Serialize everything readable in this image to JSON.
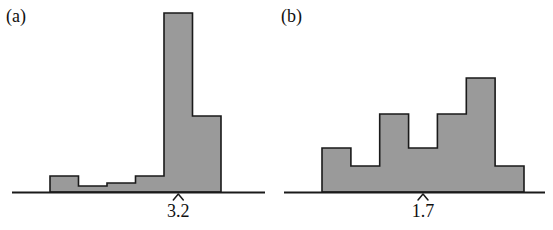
{
  "figure": {
    "background_color": "#ffffff",
    "bar_fill_color": "#9a9a9a",
    "bar_edge_color": "#1a1a1a",
    "axis_color": "#1a1a1a",
    "text_color": "#101010"
  },
  "panels": [
    {
      "id": "a",
      "label": "(a)",
      "marker_glyph": "^",
      "tick_label": "3.2"
    },
    {
      "id": "b",
      "label": "(b)",
      "marker_glyph": "^",
      "tick_label": "1.7"
    }
  ],
  "chart_data": [
    {
      "type": "bar",
      "title": "(a)",
      "subtitle": "",
      "xlabel": "",
      "ylabel": "",
      "grid": false,
      "legend": null,
      "orientation": "vertical",
      "description": "Right-skewed histogram with a tall spike near the right end; mean marker at 3.2",
      "bin_edges": [
        0.0,
        1.0,
        2.0,
        3.0,
        4.0,
        5.0,
        6.0
      ],
      "categories": [
        "bin1",
        "bin2",
        "bin3",
        "bin4",
        "bin5",
        "bin6"
      ],
      "values": [
        16,
        6,
        9,
        16,
        179,
        76
      ],
      "ylim": [
        0,
        190
      ],
      "annotations": [
        {
          "type": "mean-marker",
          "glyph": "^",
          "x_bin_index": 4,
          "label": "3.2",
          "value": 3.2
        }
      ]
    },
    {
      "type": "bar",
      "title": "(b)",
      "subtitle": "",
      "xlabel": "",
      "ylabel": "",
      "grid": false,
      "legend": null,
      "orientation": "vertical",
      "description": "Multimodal histogram rising toward the right with a dip in the middle; mean marker at 1.7",
      "bin_edges": [
        0.0,
        1.0,
        2.0,
        3.0,
        4.0,
        5.0,
        6.0,
        7.0
      ],
      "categories": [
        "bin1",
        "bin2",
        "bin3",
        "bin4",
        "bin5",
        "bin6",
        "bin7"
      ],
      "values": [
        44,
        26,
        78,
        44,
        78,
        114,
        26
      ],
      "ylim": [
        0,
        190
      ],
      "annotations": [
        {
          "type": "mean-marker",
          "glyph": "^",
          "x_bin_index": 3,
          "label": "1.7",
          "value": 1.7
        }
      ]
    }
  ]
}
